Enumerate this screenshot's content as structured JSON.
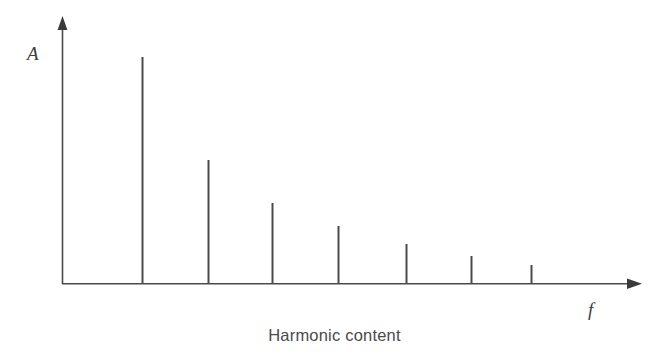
{
  "figure": {
    "background_color": "#ffffff",
    "line_color": "#4a4a4a",
    "caption": "Harmonic content",
    "y_axis_label": "A",
    "x_axis_label": "f"
  },
  "chart_data": {
    "type": "bar",
    "title": "Harmonic content",
    "xlabel": "f",
    "ylabel": "A",
    "grid": false,
    "legend": false,
    "axes_style": "arrow-tipped open axes, no tick marks, no tick labels",
    "categories": [
      "1",
      "2",
      "3",
      "4",
      "5",
      "6",
      "7"
    ],
    "category_meaning": "harmonic number (fundamental and successive harmonics of f)",
    "values": [
      227,
      124,
      81,
      58,
      40,
      28,
      19
    ],
    "values_normalized": [
      1.0,
      0.55,
      0.36,
      0.26,
      0.18,
      0.12,
      0.08
    ],
    "value_units": "relative amplitude (unlabeled axis)",
    "x_positions_px": [
      142,
      208,
      272,
      338,
      406,
      471,
      531
    ],
    "baseline_y_px": 284,
    "tops_y_px": [
      57,
      160,
      203,
      226,
      244,
      256,
      265
    ],
    "xlim": [
      62,
      641
    ],
    "ylim": [
      0,
      266
    ],
    "bar_color": "#4a4a4a",
    "bar_width_px": 2,
    "annotations": []
  },
  "geometry": {
    "y_axis": {
      "x": 62,
      "y_top": 18,
      "y_bottom": 284
    },
    "x_axis": {
      "y": 284,
      "x_left": 62,
      "x_right": 641
    },
    "y_label_pos": {
      "x": 33,
      "y": 58
    },
    "x_label_pos": {
      "x": 592,
      "y": 314
    }
  }
}
